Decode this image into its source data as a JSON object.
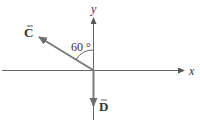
{
  "diagram": {
    "axes": {
      "x_label": "x",
      "y_label": "y"
    },
    "vectors": [
      {
        "name": "C",
        "label": "C",
        "direction": "upper-left",
        "angle_from_y_axis_deg": 60
      },
      {
        "name": "D",
        "label": "D",
        "direction": "down"
      }
    ],
    "angle_label": "60 °",
    "colors": {
      "axis": "#555555",
      "vector": "#7a7a7a",
      "text": "#333333"
    }
  }
}
